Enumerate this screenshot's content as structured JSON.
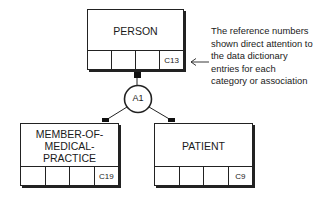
{
  "diagram": {
    "entities": [
      {
        "id": "person",
        "name": "PERSON",
        "ref": "C13"
      },
      {
        "id": "member",
        "name": "MEMBER-OF-\nMEDICAL-\nPRACTICE",
        "ref": "C19"
      },
      {
        "id": "patient",
        "name": "PATIENT",
        "ref": "C9"
      }
    ],
    "association": {
      "label": "A1"
    },
    "annotation": {
      "text": "The reference numbers\nshown direct attention to\nthe data dictionary\nentries for each\ncategory or association"
    }
  }
}
